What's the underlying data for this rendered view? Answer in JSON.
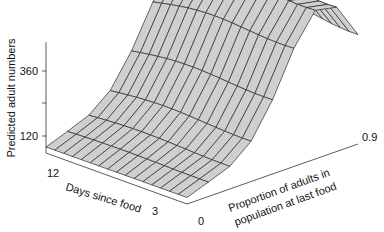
{
  "chart_data": {
    "type": "surface3d",
    "title": "",
    "zlabel": "Predicted adult numbers",
    "xlabel": "Days since food",
    "ylabel_line1": "Proportion of adults in",
    "ylabel_line2": "population at last food",
    "z_ticks": [
      "120",
      "360"
    ],
    "x_ticks": [
      "12",
      "3"
    ],
    "y_ticks": [
      "0",
      "0.9"
    ],
    "zlim": [
      0,
      480
    ],
    "x_range": [
      0,
      15
    ],
    "y_range": [
      0,
      1
    ],
    "grid_rows": 16,
    "grid_cols": 8,
    "surface_fill": "#cfcfcf",
    "line_color": "#2a2a2a"
  }
}
